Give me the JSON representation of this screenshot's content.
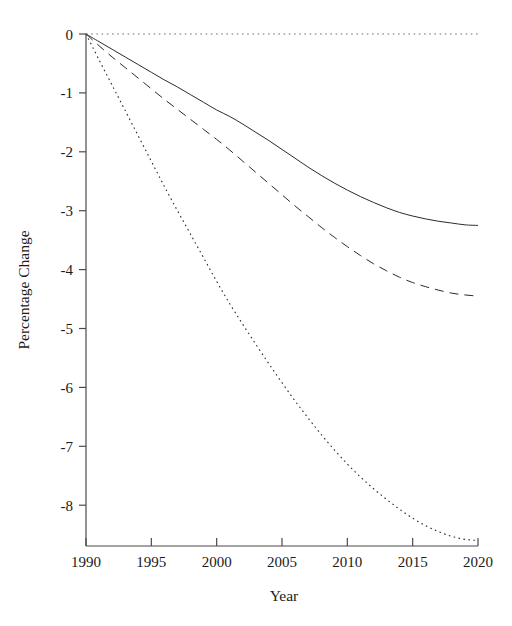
{
  "chart_data": {
    "type": "line",
    "title": "",
    "subtitle": "",
    "xlabel": "Year",
    "ylabel": "Percentage Change",
    "xlim": [
      1990,
      2020
    ],
    "ylim": [
      -8.7,
      0.15
    ],
    "grid": false,
    "legend": "none",
    "xticks": [
      1990,
      1995,
      2000,
      2005,
      2010,
      2015,
      2020
    ],
    "xtick_labels": [
      "1990",
      "1995",
      "2000",
      "2005",
      "2010",
      "2015",
      "2020"
    ],
    "yticks": [
      0,
      -1,
      -2,
      -3,
      -4,
      -5,
      -6,
      -7,
      -8
    ],
    "ytick_labels": [
      "0",
      "-1",
      "-2",
      "-3",
      "-4",
      "-5",
      "-6",
      "-7",
      "-8"
    ],
    "annotations": [
      {
        "name": "zero-reference-line",
        "style": "dotted",
        "value": 0,
        "orientation": "horizontal",
        "color": "#6f6f6f"
      }
    ],
    "x": [
      1990,
      1991,
      1992,
      1993,
      1994,
      1995,
      1996,
      1997,
      1998,
      1999,
      2000,
      2001,
      2002,
      2003,
      2004,
      2005,
      2006,
      2007,
      2008,
      2009,
      2010,
      2011,
      2012,
      2013,
      2014,
      2015,
      2016,
      2017,
      2018,
      2019,
      2020
    ],
    "series": [
      {
        "name": "solid-series",
        "style": "solid",
        "color": "#2b2b2b",
        "width": 1.0,
        "values": [
          0.0,
          -0.13,
          -0.26,
          -0.39,
          -0.52,
          -0.65,
          -0.78,
          -0.9,
          -1.03,
          -1.16,
          -1.29,
          -1.4,
          -1.53,
          -1.67,
          -1.81,
          -1.96,
          -2.11,
          -2.26,
          -2.4,
          -2.53,
          -2.65,
          -2.76,
          -2.86,
          -2.95,
          -3.03,
          -3.09,
          -3.14,
          -3.18,
          -3.21,
          -3.24,
          -3.25
        ]
      },
      {
        "name": "dashed-series",
        "style": "dashed",
        "color": "#2b2b2b",
        "width": 1.0,
        "values": [
          0.0,
          -0.2,
          -0.39,
          -0.57,
          -0.75,
          -0.93,
          -1.11,
          -1.28,
          -1.45,
          -1.62,
          -1.79,
          -1.97,
          -2.16,
          -2.35,
          -2.54,
          -2.73,
          -2.92,
          -3.1,
          -3.28,
          -3.45,
          -3.61,
          -3.76,
          -3.9,
          -4.02,
          -4.13,
          -4.22,
          -4.29,
          -4.35,
          -4.4,
          -4.43,
          -4.45
        ]
      },
      {
        "name": "dotted-series",
        "style": "dotted",
        "color": "#6f6f6f",
        "width": 1.1,
        "values": [
          0.0,
          -0.44,
          -0.87,
          -1.3,
          -1.73,
          -2.16,
          -2.59,
          -3.0,
          -3.4,
          -3.8,
          -4.2,
          -4.58,
          -4.93,
          -5.27,
          -5.6,
          -5.92,
          -6.23,
          -6.52,
          -6.8,
          -7.06,
          -7.3,
          -7.52,
          -7.72,
          -7.9,
          -8.07,
          -8.22,
          -8.35,
          -8.45,
          -8.53,
          -8.58,
          -8.6
        ]
      }
    ]
  }
}
